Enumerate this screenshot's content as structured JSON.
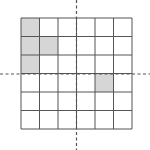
{
  "diagram": {
    "type": "grid",
    "rows": 6,
    "cols": 6,
    "origin": {
      "x": 21,
      "y": 18
    },
    "cell_size": 18.5,
    "line_color": "#555555",
    "fill_color": "#d6d6d6",
    "axis_color": "#555555",
    "shaded_cells": [
      {
        "row": 0,
        "col": 0
      },
      {
        "row": 1,
        "col": 0
      },
      {
        "row": 1,
        "col": 1
      },
      {
        "row": 2,
        "col": 0
      },
      {
        "row": 3,
        "col": 4
      }
    ],
    "axes": {
      "vertical_x": 76.5,
      "horizontal_y": 74
    }
  }
}
